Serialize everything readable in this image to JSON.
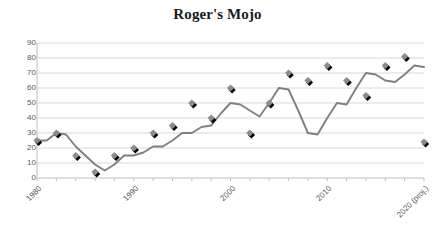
{
  "chart_data": {
    "type": "line",
    "title": "Roger's Mojo",
    "xlabel": "",
    "ylabel": "",
    "ylim": [
      0,
      90
    ],
    "ytick_values": [
      0,
      10,
      20,
      30,
      40,
      50,
      60,
      70,
      80,
      90
    ],
    "ytick_labels": [
      "0",
      "10",
      "20",
      "30",
      "40",
      "50",
      "60",
      "70",
      "80",
      "90"
    ],
    "xlim": [
      1980,
      2020
    ],
    "xtick_values": [
      1980,
      1990,
      2000,
      2010,
      2020
    ],
    "xtick_labels": [
      "1980",
      "1990",
      "2000",
      "2010",
      "2020 (proj.)"
    ],
    "grid": "horizontal",
    "legend": "none",
    "x": [
      1980,
      1981,
      1982,
      1983,
      1984,
      1985,
      1986,
      1987,
      1988,
      1989,
      1990,
      1991,
      1992,
      1993,
      1994,
      1995,
      1996,
      1997,
      1998,
      1999,
      2000,
      2001,
      2002,
      2003,
      2004,
      2005,
      2006,
      2007,
      2008,
      2009,
      2010,
      2011,
      2012,
      2013,
      2014,
      2015,
      2016,
      2017,
      2018,
      2019,
      2020
    ],
    "values": [
      25,
      25,
      30,
      29,
      21,
      15,
      9,
      5,
      9,
      15,
      15,
      17,
      21,
      21,
      25,
      30,
      30,
      34,
      35,
      43,
      50,
      49,
      45,
      41,
      50,
      60,
      59,
      45,
      30,
      29,
      40,
      50,
      49,
      60,
      70,
      69,
      65,
      64,
      69,
      75,
      74
    ]
  },
  "series_points": [
    {
      "x": 1980,
      "y": 25
    },
    {
      "x": 1982,
      "y": 30
    },
    {
      "x": 1984,
      "y": 15
    },
    {
      "x": 1986,
      "y": 4
    },
    {
      "x": 1988,
      "y": 15
    },
    {
      "x": 1990,
      "y": 20
    },
    {
      "x": 1992,
      "y": 30
    },
    {
      "x": 1994,
      "y": 35
    },
    {
      "x": 1996,
      "y": 50
    },
    {
      "x": 1998,
      "y": 40
    },
    {
      "x": 2000,
      "y": 60
    },
    {
      "x": 2002,
      "y": 30
    },
    {
      "x": 2004,
      "y": 50
    },
    {
      "x": 2006,
      "y": 70
    },
    {
      "x": 2008,
      "y": 65
    },
    {
      "x": 2010,
      "y": 75
    },
    {
      "x": 2012,
      "y": 65
    },
    {
      "x": 2014,
      "y": 55
    },
    {
      "x": 2016,
      "y": 75
    },
    {
      "x": 2018,
      "y": 81
    },
    {
      "x": 2020,
      "y": 24
    }
  ],
  "style": {
    "line_color": "#808080",
    "marker_fill": "#8c8c8c",
    "marker_shadow": "#000000",
    "grid_color": "#d9d9d9",
    "axis_color": "#bfbfbf",
    "tick_text_color": "#595959",
    "title_color": "#1a1a1a",
    "background": "#ffffff"
  }
}
